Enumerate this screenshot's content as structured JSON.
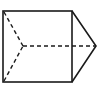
{
  "diagram": {
    "type": "geometric-solid-3d-view",
    "stroke_color": "#1a1a1a",
    "background": "#ffffff",
    "square": {
      "x1": 3,
      "y1": 11,
      "x2": 72,
      "y2": 82
    },
    "apex": {
      "x": 96,
      "y": 46
    },
    "hidden_vertex": {
      "x": 23,
      "y": 46
    }
  }
}
